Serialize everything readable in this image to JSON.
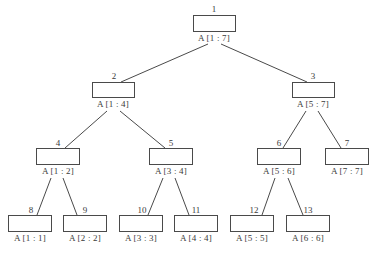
{
  "diagram": {
    "type": "segment-tree",
    "nodes": [
      {
        "id": "1",
        "index": "1",
        "range": "A [1 : 7]",
        "children": [
          "2",
          "3"
        ]
      },
      {
        "id": "2",
        "index": "2",
        "range": "A [1 : 4]",
        "children": [
          "4",
          "5"
        ]
      },
      {
        "id": "3",
        "index": "3",
        "range": "A [5 : 7]",
        "children": [
          "6",
          "7"
        ]
      },
      {
        "id": "4",
        "index": "4",
        "range": "A [1 : 2]",
        "children": [
          "8",
          "9"
        ]
      },
      {
        "id": "5",
        "index": "5",
        "range": "A [3 : 4]",
        "children": [
          "10",
          "11"
        ]
      },
      {
        "id": "6",
        "index": "6",
        "range": "A [5 : 6]",
        "children": [
          "12",
          "13"
        ]
      },
      {
        "id": "7",
        "index": "7",
        "range": "A [7 : 7]",
        "children": []
      },
      {
        "id": "8",
        "index": "8",
        "range": "A [1 : 1]",
        "children": []
      },
      {
        "id": "9",
        "index": "9",
        "range": "A [2 : 2]",
        "children": []
      },
      {
        "id": "10",
        "index": "10",
        "range": "A [3 : 3]",
        "children": []
      },
      {
        "id": "11",
        "index": "11",
        "range": "A [4 : 4]",
        "children": []
      },
      {
        "id": "12",
        "index": "12",
        "range": "A [5 : 5]",
        "children": []
      },
      {
        "id": "13",
        "index": "13",
        "range": "A [6 : 6]",
        "children": []
      }
    ],
    "edges": [
      {
        "from": "1",
        "to": "2"
      },
      {
        "from": "1",
        "to": "3"
      },
      {
        "from": "2",
        "to": "4"
      },
      {
        "from": "2",
        "to": "5"
      },
      {
        "from": "3",
        "to": "6"
      },
      {
        "from": "3",
        "to": "7"
      },
      {
        "from": "4",
        "to": "8"
      },
      {
        "from": "4",
        "to": "9"
      },
      {
        "from": "5",
        "to": "10"
      },
      {
        "from": "5",
        "to": "11"
      },
      {
        "from": "6",
        "to": "12"
      },
      {
        "from": "6",
        "to": "13"
      }
    ],
    "colors": {
      "stroke": "#4a4a4a",
      "text": "#3a3a3a",
      "background": "#ffffff"
    }
  }
}
